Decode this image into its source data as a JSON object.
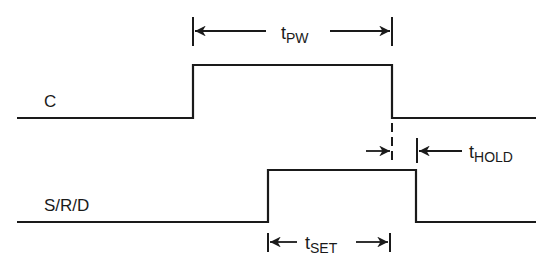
{
  "diagram": {
    "type": "timing-diagram",
    "signals": [
      {
        "name": "C",
        "low_y": 118,
        "high_y": 65,
        "x_start": 17,
        "rise_x": 193,
        "fall_x": 392,
        "x_end": 536
      },
      {
        "name": "S/R/D",
        "low_y": 222,
        "high_y": 170,
        "x_start": 17,
        "rise_x": 268,
        "fall_x": 416,
        "x_end": 536
      }
    ],
    "annotations": {
      "pulse_width": {
        "symbol": "t",
        "subscript": "PW",
        "from_x": 193,
        "to_x": 392,
        "y": 31
      },
      "setup_time": {
        "symbol": "t",
        "subscript": "SET",
        "from_x": 268,
        "to_x": 390,
        "y": 242
      },
      "hold_time": {
        "symbol": "t",
        "subscript": "HOLD",
        "from_x": 392,
        "to_x": 417,
        "y": 151
      }
    },
    "stroke_color": "#1a1a1a",
    "background": "#ffffff"
  }
}
